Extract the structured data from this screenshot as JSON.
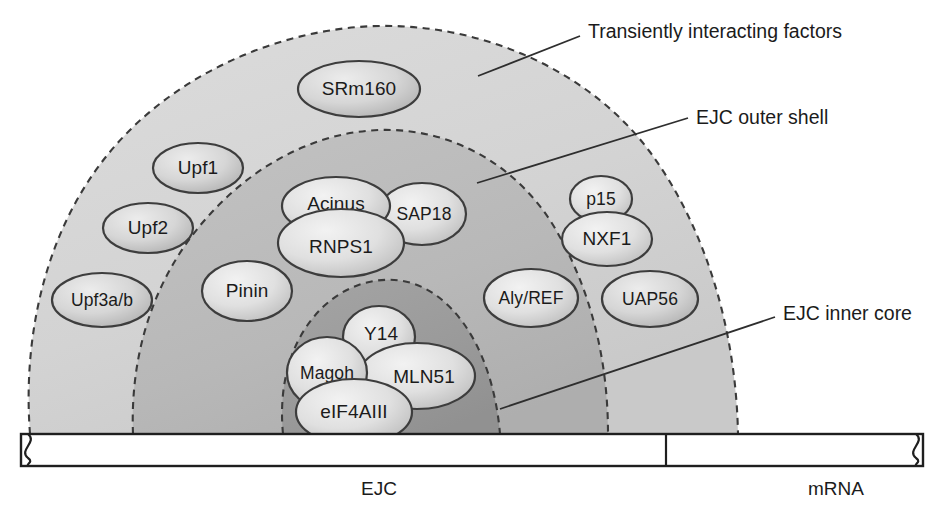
{
  "diagram": {
    "background_color": "#ffffff"
  },
  "shells": [
    {
      "id": "transient",
      "name": "Transiently interacting factors",
      "label": "Transiently interacting factors",
      "fill": "#d4d4d4",
      "label_x": 588,
      "label_y": 33,
      "leader": "M 478 76 L 580 36"
    },
    {
      "id": "outer",
      "name": "EJC outer shell",
      "label": "EJC outer shell",
      "fill": "#b9b9b9",
      "label_x": 696,
      "label_y": 119,
      "leader": "M 477 183 L 688 118"
    },
    {
      "id": "inner",
      "name": "EJC inner core",
      "label": "EJC inner core",
      "fill": "#9b9b9b",
      "label_x": 783,
      "label_y": 315,
      "leader": "M 500 409 L 775 317"
    }
  ],
  "proteins": [
    {
      "id": "srm160",
      "label": "SRm160",
      "shell": "transient",
      "cx": 359,
      "cy": 89,
      "rx": 61,
      "ry": 28
    },
    {
      "id": "upf1",
      "label": "Upf1",
      "shell": "transient",
      "cx": 198,
      "cy": 168,
      "rx": 45,
      "ry": 25
    },
    {
      "id": "upf2",
      "label": "Upf2",
      "shell": "transient",
      "cx": 148,
      "cy": 228,
      "rx": 45,
      "ry": 25
    },
    {
      "id": "upf3ab",
      "label": "Upf3a/b",
      "shell": "transient",
      "cx": 102,
      "cy": 300,
      "rx": 50,
      "ry": 27
    },
    {
      "id": "p15",
      "label": "p15",
      "shell": "outer",
      "cx": 601,
      "cy": 199,
      "rx": 31,
      "ry": 23
    },
    {
      "id": "nxf1",
      "label": "NXF1",
      "shell": "outer",
      "cx": 607,
      "cy": 239,
      "rx": 45,
      "ry": 27
    },
    {
      "id": "uap56",
      "label": "UAP56",
      "shell": "transient",
      "cx": 650,
      "cy": 299,
      "rx": 48,
      "ry": 28
    },
    {
      "id": "acinus",
      "label": "Acinus",
      "shell": "outer",
      "cx": 336,
      "cy": 206,
      "rx": 54,
      "ry": 29
    },
    {
      "id": "sap18",
      "label": "SAP18",
      "shell": "outer",
      "cx": 422,
      "cy": 214,
      "rx": 44,
      "ry": 31
    },
    {
      "id": "rnps1",
      "label": "RNPS1",
      "shell": "outer",
      "cx": 341,
      "cy": 243,
      "rx": 63,
      "ry": 34
    },
    {
      "id": "pinin",
      "label": "Pinin",
      "shell": "outer",
      "cx": 247,
      "cy": 291,
      "rx": 45,
      "ry": 30
    },
    {
      "id": "alyref",
      "label": "Aly/REF",
      "shell": "outer",
      "cx": 531,
      "cy": 298,
      "rx": 47,
      "ry": 29
    },
    {
      "id": "y14",
      "label": "Y14",
      "shell": "inner",
      "cx": 379,
      "cy": 337,
      "rx": 36,
      "ry": 31
    },
    {
      "id": "magoh",
      "label": "Magoh",
      "shell": "inner",
      "cx": 327,
      "cy": 373,
      "rx": 40,
      "ry": 36
    },
    {
      "id": "mln51",
      "label": "MLN51",
      "shell": "inner",
      "cx": 417,
      "cy": 376,
      "rx": 58,
      "ry": 33
    },
    {
      "id": "eif4aiii",
      "label": "eIF4AIII",
      "shell": "inner",
      "cx": 354,
      "cy": 412,
      "rx": 58,
      "ry": 33
    }
  ],
  "mrna": {
    "label": "mRNA",
    "label_x": 836,
    "label_y": 490,
    "bar_x": 21,
    "bar_y": 434,
    "bar_width": 902,
    "bar_height": 32,
    "tick_x": 666
  },
  "ejc": {
    "label": "EJC",
    "label_x": 379,
    "label_y": 490
  },
  "colors": {
    "transient_fill": "#d4d4d4",
    "outer_fill": "#b9b9b9",
    "inner_fill": "#9b9b9b",
    "protein_fill_light": "#e2e2e2",
    "protein_fill_mid": "#c8c8c8",
    "outline": "#3d3d3d",
    "text": "#1b1b1b"
  }
}
